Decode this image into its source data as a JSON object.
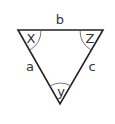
{
  "diagram": {
    "type": "triangle",
    "sides": {
      "top": "b",
      "left": "a",
      "right": "c"
    },
    "angles": {
      "top_left": "X",
      "top_right": "Z",
      "bottom": "y"
    },
    "colors": {
      "stroke": "#222222",
      "text": "#333333",
      "background": "#ffffff"
    }
  }
}
